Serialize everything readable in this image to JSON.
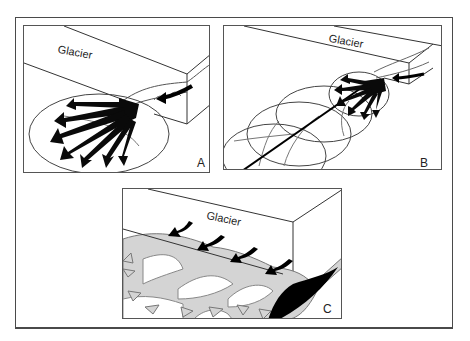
{
  "figure": {
    "panels": [
      {
        "id": "A",
        "letter": "A",
        "glacier_label": "Glacier",
        "description": "Single fan with radiating dark outflow arrows"
      },
      {
        "id": "B",
        "letter": "B",
        "glacier_label": "Glacier",
        "description": "Small fan atop successive overlapping older fan lobes with a main channel"
      },
      {
        "id": "C",
        "letter": "C",
        "glacier_label": "Glacier",
        "description": "Multiple dark inflow points along ice margin feeding light-grey branching outflow arrows; dark deposit at right"
      }
    ]
  },
  "colors": {
    "line": "#333333",
    "arrow_dark": "#0a0a0a",
    "arrow_light": "#d4d4d4",
    "background": "#ffffff"
  }
}
